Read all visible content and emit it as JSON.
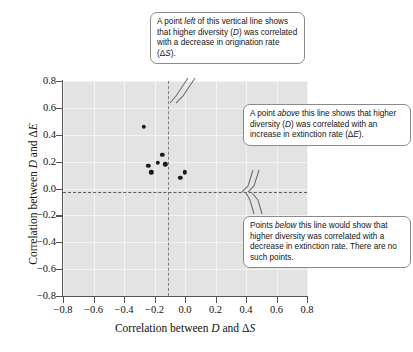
{
  "chart_data": {
    "type": "scatter",
    "title": "",
    "xlabel": "Correlation between D and ΔS",
    "ylabel": "Correlation between D and ΔE",
    "xlim": [
      -0.8,
      0.8
    ],
    "ylim": [
      -0.8,
      0.8
    ],
    "grid": true,
    "legend": "none",
    "xticks": [
      "−0.8",
      "−0.6",
      "−0.4",
      "−0.2",
      "0.0",
      "0.2",
      "0.4",
      "0.6",
      "0.8"
    ],
    "xtick_values": [
      -0.8,
      -0.6,
      -0.4,
      -0.2,
      0.0,
      0.2,
      0.4,
      0.6,
      0.8
    ],
    "yticks": [
      "0.8",
      "0.6",
      "0.4",
      "0.2",
      "0.0",
      "−0.2",
      "−0.4",
      "−0.6",
      "−0.8"
    ],
    "ytick_values": [
      0.8,
      0.6,
      0.4,
      0.2,
      0.0,
      -0.2,
      -0.4,
      -0.6,
      -0.8
    ],
    "points": [
      {
        "x": -0.27,
        "y": 0.46
      },
      {
        "x": -0.24,
        "y": 0.17
      },
      {
        "x": -0.22,
        "y": 0.12
      },
      {
        "x": -0.18,
        "y": 0.19
      },
      {
        "x": -0.15,
        "y": 0.25
      },
      {
        "x": -0.13,
        "y": 0.18
      },
      {
        "x": -0.03,
        "y": 0.08
      },
      {
        "x": 0.0,
        "y": 0.12
      }
    ],
    "reference_lines": [
      {
        "orientation": "vertical",
        "value": 0.0,
        "style": "dashed"
      },
      {
        "orientation": "horizontal",
        "value": 0.0,
        "style": "dashed"
      }
    ],
    "annotations": [
      "A point left of this vertical line shows that higher diversity (D) was correlated with a decrease in origination rate (ΔS).",
      "A point above this line shows that higher diversity (D) was correlated with an increase in extinction rate (ΔE).",
      "Points below this line would show that higher diversity was correlated with a decrease in extinction rate. There are no such points."
    ]
  },
  "axes": {
    "x_title_pre": "Correlation between ",
    "x_title_d": "D",
    "x_title_mid": " and Δ",
    "x_title_s": "S",
    "y_title_pre": "Correlation between ",
    "y_title_d": "D",
    "y_title_mid": " and Δ",
    "y_title_e": "E"
  },
  "callouts": {
    "top": {
      "line1_a": "A point ",
      "line1_em": "left",
      "line1_b": " of this vertical line",
      "line2_a": "shows that higher diversity (",
      "line2_em": "D",
      "line2_b": ")",
      "line3": "was correlated with a decrease",
      "line4_a": "in origination rate (Δ",
      "line4_em": "S",
      "line4_b": ")."
    },
    "middle": {
      "line1_a": "A point ",
      "line1_em": "above",
      "line1_b": " this line shows",
      "line2_a": "that higher diversity (",
      "line2_em": "D",
      "line2_b": ") was",
      "line3": "correlated with an increase",
      "line4_a": "in extinction rate (Δ",
      "line4_em": "E",
      "line4_b": ")."
    },
    "bottom": {
      "line1_a": "Points ",
      "line1_em": "below",
      "line1_b": " this line would",
      "line2": "show that higher diversity",
      "line3": "was correlated with a",
      "line4": "decrease in extinction rate.",
      "line5": "There are no such points."
    }
  }
}
